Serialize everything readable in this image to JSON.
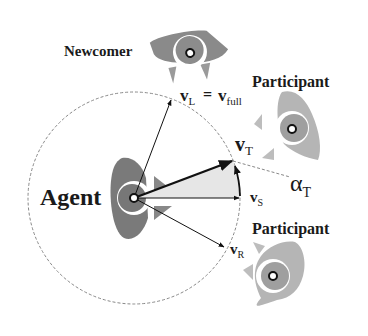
{
  "labels": {
    "agent": "Agent",
    "newcomer": "Newcomer",
    "participant_top": "Participant",
    "participant_bottom": "Participant"
  },
  "vectors": {
    "v_L": {
      "symbol": "v",
      "sub": "L"
    },
    "equals": "=",
    "v_full": {
      "symbol": "v",
      "sub": "full"
    },
    "v_T": {
      "symbol": "v",
      "sub": "T"
    },
    "v_S": {
      "symbol": "v",
      "sub": "S"
    },
    "v_R": {
      "symbol": "v",
      "sub": "R"
    }
  },
  "angle": {
    "symbol": "α",
    "sub": "T"
  },
  "colors": {
    "agent_body": "#7a7a7a",
    "newcomer_body": "#8a8a8a",
    "participant_body": "#b5b5b5",
    "participant_head": "#9a9a9a",
    "sector_fill": "#e6e6e6",
    "arrow": "#111111",
    "dashed_circle": "#888888"
  }
}
